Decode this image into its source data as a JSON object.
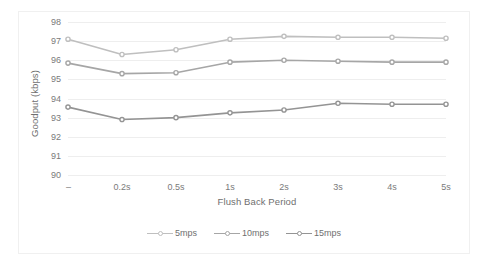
{
  "chart_data": {
    "type": "line",
    "title": "",
    "xlabel": "Flush Back Period",
    "ylabel": "Goodput (kbps)",
    "categories": [
      "–",
      "0.2s",
      "0.5s",
      "1s",
      "2s",
      "3s",
      "4s",
      "5s"
    ],
    "ylim": [
      90,
      98
    ],
    "yticks": [
      90,
      91,
      92,
      93,
      94,
      95,
      96,
      97,
      98
    ],
    "ytick_labels": [
      "90",
      "91",
      "92",
      "93",
      "94",
      "95",
      "96",
      "97",
      "98"
    ],
    "grid": true,
    "grid_axis": "y",
    "legend_position": "bottom",
    "series": [
      {
        "name": "5mps",
        "color": "#bfbfbf",
        "values": [
          97.1,
          96.3,
          96.55,
          97.1,
          97.25,
          97.2,
          97.2,
          97.15
        ]
      },
      {
        "name": "10mps",
        "color": "#a6a6a6",
        "values": [
          95.85,
          95.3,
          95.35,
          95.9,
          96.0,
          95.95,
          95.9,
          95.9
        ]
      },
      {
        "name": "15mps",
        "color": "#949494",
        "values": [
          93.55,
          92.9,
          93.0,
          93.25,
          93.4,
          93.75,
          93.7,
          93.7
        ]
      }
    ]
  },
  "colors": {
    "gridline": "#eeeeee",
    "tick_text": "#7a7a7a",
    "axis_title_text": "#6f6f6f",
    "background": "#ffffff",
    "frame": "#f0f0f0"
  }
}
